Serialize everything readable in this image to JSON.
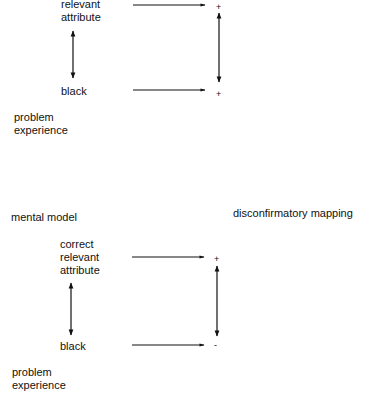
{
  "diagram_top": {
    "concept_label": "relevant\nattribute",
    "instance_label": "black",
    "context_label": "problem\nexperience",
    "concept_sign": "+",
    "instance_sign": "+"
  },
  "diagram_bottom": {
    "title_left": "mental model",
    "title_right": "disconfirmatory mapping",
    "concept_label": "correct\nrelevant\nattribute",
    "instance_label": "black",
    "context_label": "problem\nexperience",
    "concept_sign": "+",
    "instance_sign": "-"
  },
  "colors": {
    "ink": "#111111",
    "background": "#ffffff"
  }
}
